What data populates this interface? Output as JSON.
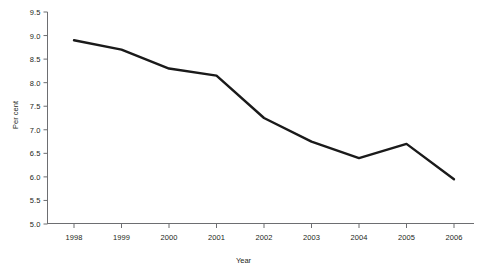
{
  "chart_data": {
    "type": "line",
    "title": "",
    "subtitle": "",
    "xlabel": "Year",
    "ylabel": "Per cent",
    "categories": [
      "1998",
      "1999",
      "2000",
      "2001",
      "2002",
      "2003",
      "2004",
      "2005",
      "2006"
    ],
    "x": [
      1998,
      1999,
      2000,
      2001,
      2002,
      2003,
      2004,
      2005,
      2006
    ],
    "values": [
      8.9,
      8.7,
      8.3,
      8.15,
      7.25,
      6.75,
      6.4,
      6.7,
      5.95
    ],
    "series": [
      {
        "name": "Per cent",
        "values": [
          8.9,
          8.7,
          8.3,
          8.15,
          7.25,
          6.75,
          6.4,
          6.7,
          5.95
        ],
        "color": "#1a1a1a",
        "line_width": 2.4,
        "markers": false
      }
    ],
    "ylim": [
      5.0,
      9.5
    ],
    "ytick_values": [
      5.0,
      5.5,
      6.0,
      6.5,
      7.0,
      7.5,
      8.0,
      8.5,
      9.0,
      9.5
    ],
    "ytick_labels": [
      "5.0",
      "5.5",
      "6.0",
      "6.5",
      "7.0",
      "7.5",
      "8.0",
      "8.5",
      "9.0",
      "9.5"
    ],
    "xtick_labels": [
      "1998",
      "1999",
      "2000",
      "2001",
      "2002",
      "2003",
      "2004",
      "2005",
      "2006"
    ],
    "grid": false,
    "legend": null,
    "legend_position": "none",
    "annotations": [],
    "axis_color": "#6d6e71",
    "background": "#ffffff"
  },
  "axes": {
    "x_title": "Year",
    "y_title": "Per cent"
  }
}
